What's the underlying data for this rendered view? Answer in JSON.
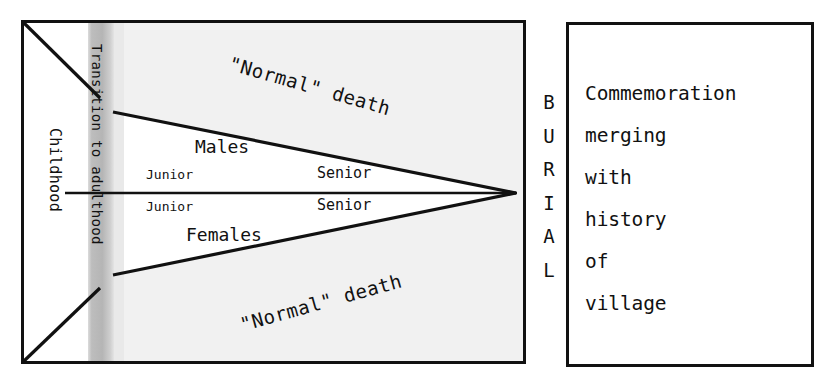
{
  "figure": {
    "type": "lifecycle-diagram",
    "left_panel": {
      "name": "life-course-panel",
      "vertical_labels": [
        {
          "id": "childhood",
          "text": "Childhood"
        },
        {
          "id": "transition",
          "text": "Transition to adulthood"
        }
      ],
      "upper_track": {
        "group_label": "Males",
        "stage_labels": [
          "Junior",
          "Senior"
        ],
        "outcome_label": "\"Normal\" death"
      },
      "lower_track": {
        "group_label": "Females",
        "stage_labels": [
          "Junior",
          "Senior"
        ],
        "outcome_label": "\"Normal\" death"
      }
    },
    "connector": {
      "name": "burial-connector",
      "text": "BURIAL",
      "letters": [
        "B",
        "U",
        "R",
        "I",
        "A",
        "L"
      ]
    },
    "right_panel": {
      "name": "commemoration-box",
      "lines": [
        "Commemoration",
        "merging",
        "with",
        "history",
        "of",
        "village"
      ]
    },
    "colors": {
      "ink": "#111111",
      "panel_background": "#f1f1f1",
      "transition_band": "#b9b9b9",
      "transition_band_soft": "#d6d6d6",
      "white": "#ffffff"
    }
  }
}
